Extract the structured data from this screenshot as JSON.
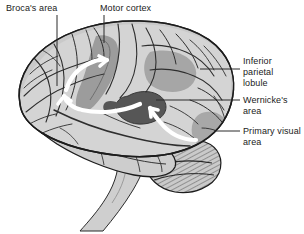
{
  "figure": {
    "background_color": "#ffffff",
    "width": 304,
    "height": 234
  },
  "palette": {
    "outline": "#1c1c1c",
    "cortex_light": "#d6d6d6",
    "cortex_mid": "#bdbdbd",
    "cortex_shadow": "#a8a8a8",
    "region_motor": "#9a9a9a",
    "region_parietal": "#a3a3a3",
    "region_wernickes": "#5a5a5a",
    "region_visual": "#9e9e9e",
    "cerebellum": "#c9c9c9",
    "brainstem": "#cfcfcf",
    "arrow": "#ffffff",
    "leader_line": "#2b2b2b",
    "text": "#1a1a1a"
  },
  "labels": [
    {
      "id": "brocas-area",
      "text": "Broca's area",
      "side": "top-left",
      "leader": {
        "x1": 57,
        "y1": 15,
        "x2": 57,
        "y2": 86
      }
    },
    {
      "id": "motor-cortex",
      "text": "Motor cortex",
      "side": "top-right",
      "leader": {
        "x1": 104,
        "y1": 15,
        "x2": 104,
        "y2": 43
      }
    },
    {
      "id": "inferior-parietal-lobule",
      "text": "Inferior parietal\nlobule",
      "side": "right",
      "leader": {
        "x1": 240,
        "y1": 69,
        "x2": 200,
        "y2": 69
      }
    },
    {
      "id": "wernickes-area",
      "text": "Wernicke's area",
      "side": "right",
      "leader": {
        "x1": 240,
        "y1": 100,
        "x2": 156,
        "y2": 100
      }
    },
    {
      "id": "primary-visual-area",
      "text": "Primary visual\narea",
      "side": "right",
      "leader": {
        "x1": 240,
        "y1": 131,
        "x2": 214,
        "y2": 131
      }
    }
  ],
  "regions": [
    {
      "id": "motor-cortex-band",
      "shade": "region_motor",
      "description": "darker vertical gyral band at the precentral gyrus"
    },
    {
      "id": "inferior-parietal-patch",
      "shade": "region_parietal",
      "description": "mid-gray patch above the posterior sylvian fissure"
    },
    {
      "id": "wernickes-patch",
      "shade": "region_wernickes",
      "description": "dark gray patch in the posterior superior temporal gyrus"
    },
    {
      "id": "primary-visual-patch",
      "shade": "region_visual",
      "description": "gray occipital pole region"
    },
    {
      "id": "cerebellum",
      "shade": "cerebellum",
      "description": "hatched lobed structure below the occipital lobe"
    },
    {
      "id": "brainstem",
      "shade": "brainstem",
      "description": "tapering stalk descending from the base of the brain"
    }
  ],
  "arrows": [
    {
      "id": "wernickes-to-brocas-arrow",
      "color_key": "arrow",
      "description": "white curved arrow sweeping from temporal region forward and up to Broca's area"
    },
    {
      "id": "brocas-to-motor-arrow",
      "color_key": "arrow",
      "description": "white curved arrow from Broca's area arcing up into motor cortex"
    },
    {
      "id": "visual-to-wernickes-arrow",
      "color_key": "arrow",
      "description": "white curved arrow from the occipital area forward to Wernicke's area"
    }
  ]
}
